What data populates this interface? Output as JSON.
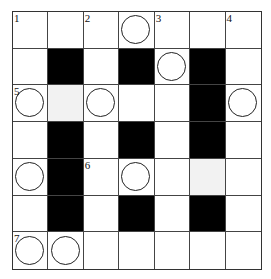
{
  "puzzle": {
    "type": "crossword",
    "rows": 7,
    "cols": 7,
    "cells": [
      [
        {
          "n": "1"
        },
        {},
        {
          "n": "2"
        },
        {
          "circle": true
        },
        {
          "n": "3"
        },
        {},
        {
          "n": "4"
        }
      ],
      [
        {},
        {
          "black": true
        },
        {},
        {
          "black": true
        },
        {
          "circle": true
        },
        {
          "black": true
        },
        {}
      ],
      [
        {
          "n": "5",
          "circle": true
        },
        {
          "gray": true
        },
        {
          "circle": true
        },
        {},
        {},
        {
          "black": true
        },
        {
          "circle": true
        }
      ],
      [
        {},
        {
          "black": true
        },
        {},
        {
          "black": true
        },
        {},
        {
          "black": true
        },
        {}
      ],
      [
        {
          "circle": true
        },
        {
          "black": true
        },
        {
          "n": "6"
        },
        {
          "circle": true
        },
        {},
        {
          "gray": true
        },
        {}
      ],
      [
        {},
        {
          "black": true
        },
        {},
        {
          "black": true
        },
        {},
        {
          "black": true
        },
        {}
      ],
      [
        {
          "n": "7",
          "circle": true
        },
        {
          "circle": true
        },
        {},
        {},
        {},
        {},
        {}
      ]
    ]
  },
  "colors": {
    "black": "#000000",
    "gray": "#f2f2f2",
    "line": "#444444"
  }
}
